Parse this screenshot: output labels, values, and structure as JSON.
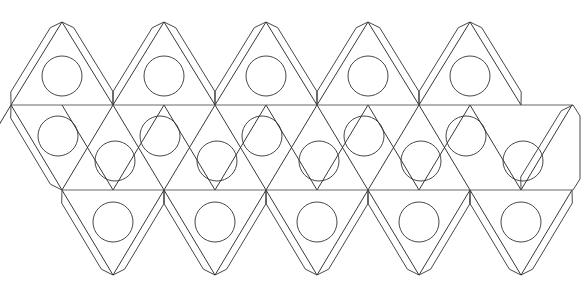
{
  "document": {
    "title": "Icosahedron Net",
    "kind": "papercraft-fold-template",
    "background_color": "#ffffff",
    "width": 583,
    "height": 292
  },
  "style": {
    "edge_color": "#222222",
    "fold_color": "#555555",
    "tab_color": "#333333",
    "circle_color": "#333333",
    "stroke_width": 0.9
  },
  "geometry": {
    "triangle_half_width": 51,
    "column_pitch": 102,
    "band_height": 85,
    "top_band_baseline_y": 105,
    "middle_band_baseline_y": 190,
    "bottom_band_apex_y": 275,
    "top_apex_y": 22,
    "left_origin_x": 11,
    "right_end_x": 573,
    "tab_depth": 7,
    "tab_inset": 11,
    "circle_radius": 20,
    "columns": 5
  },
  "chart_data": {
    "type": "diagram",
    "faces_total": 20,
    "bands": [
      {
        "name": "top-band",
        "orientation": "up",
        "count": 5,
        "baseline_y": 105,
        "apex_y": 22,
        "apex_x": [
          62,
          164,
          266,
          368,
          470
        ],
        "circles": [
          {
            "cx": 62,
            "cy": 76,
            "r": 20
          },
          {
            "cx": 164,
            "cy": 76,
            "r": 20
          },
          {
            "cx": 266,
            "cy": 76,
            "r": 20
          },
          {
            "cx": 368,
            "cy": 76,
            "r": 20
          },
          {
            "cx": 470,
            "cy": 76,
            "r": 20
          }
        ]
      },
      {
        "name": "middle-upper-band",
        "orientation": "up",
        "count": 5,
        "baseline_y": 190,
        "apex_y": 105,
        "apex_x": [
          11,
          113,
          215,
          317,
          419
        ],
        "circles": [
          {
            "cx": 58,
            "cy": 136,
            "r": 20
          },
          {
            "cx": 160,
            "cy": 136,
            "r": 20
          },
          {
            "cx": 262,
            "cy": 136,
            "r": 20
          },
          {
            "cx": 364,
            "cy": 136,
            "r": 20
          },
          {
            "cx": 466,
            "cy": 136,
            "r": 20
          }
        ]
      },
      {
        "name": "middle-lower-band",
        "orientation": "down",
        "count": 5,
        "baseline_y": 105,
        "apex_y": 190,
        "apex_x": [
          113,
          215,
          317,
          419,
          521
        ],
        "circles": [
          {
            "cx": 115,
            "cy": 161,
            "r": 20
          },
          {
            "cx": 217,
            "cy": 161,
            "r": 20
          },
          {
            "cx": 319,
            "cy": 161,
            "r": 20
          },
          {
            "cx": 421,
            "cy": 161,
            "r": 20
          },
          {
            "cx": 523,
            "cy": 161,
            "r": 20
          }
        ]
      },
      {
        "name": "bottom-band",
        "orientation": "down",
        "count": 5,
        "baseline_y": 190,
        "apex_y": 275,
        "apex_x": [
          113,
          215,
          317,
          419,
          521
        ],
        "circles": [
          {
            "cx": 113,
            "cy": 222,
            "r": 20
          },
          {
            "cx": 215,
            "cy": 222,
            "r": 20
          },
          {
            "cx": 317,
            "cy": 222,
            "r": 20
          },
          {
            "cx": 419,
            "cy": 222,
            "r": 20
          },
          {
            "cx": 521,
            "cy": 222,
            "r": 20
          }
        ]
      }
    ],
    "fold_lines": [
      {
        "name": "upper-horizontal-fold",
        "x1": 11,
        "y1": 105,
        "x2": 573,
        "y2": 105
      },
      {
        "name": "lower-horizontal-fold",
        "x1": 62,
        "y1": 190,
        "x2": 573,
        "y2": 190
      }
    ],
    "glue_tabs": {
      "top_band_left_edges": 5,
      "top_band_right_edges": 5,
      "bottom_band_left_edges": 5,
      "bottom_band_right_edges": 5,
      "left_end_edge": 1,
      "right_end_edge": 2,
      "total": 23
    }
  }
}
